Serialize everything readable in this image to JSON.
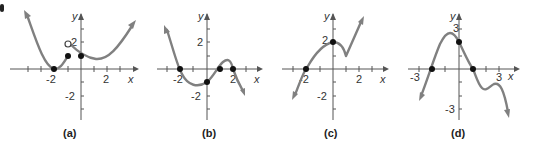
{
  "figure": {
    "panels": [
      {
        "id": "a",
        "caption": "(a)",
        "x_axis_label": "x",
        "y_axis_label": "y",
        "x_tick_labels": [
          "-2",
          "2"
        ],
        "y_tick_labels": [
          "2",
          "-2"
        ],
        "filled_points": [
          [
            -2,
            0
          ],
          [
            -1,
            1
          ],
          [
            0,
            1
          ]
        ],
        "open_points": [
          [
            -1,
            2
          ]
        ]
      },
      {
        "id": "b",
        "caption": "(b)",
        "x_axis_label": "x",
        "y_axis_label": "y",
        "x_tick_labels": [
          "-2",
          "2"
        ],
        "y_tick_labels": [
          "2",
          "-2"
        ],
        "filled_points": [
          [
            -2,
            0
          ],
          [
            0,
            -1
          ],
          [
            1,
            0
          ],
          [
            2,
            0
          ]
        ],
        "open_points": []
      },
      {
        "id": "c",
        "caption": "(c)",
        "x_axis_label": "x",
        "y_axis_label": "y",
        "x_tick_labels": [
          "-2",
          "2"
        ],
        "y_tick_labels": [
          "2",
          "-2"
        ],
        "filled_points": [
          [
            -2,
            0
          ],
          [
            0,
            2
          ]
        ],
        "open_points": []
      },
      {
        "id": "d",
        "caption": "(d)",
        "x_axis_label": "x",
        "y_axis_label": "y",
        "x_tick_labels": [
          "-3",
          "3"
        ],
        "y_tick_labels": [
          "3",
          "-3"
        ],
        "filled_points": [
          [
            -2,
            0
          ],
          [
            0,
            2
          ],
          [
            1,
            0
          ]
        ],
        "open_points": []
      }
    ]
  },
  "colors": {
    "curve": "#808080",
    "axis": "#555555",
    "point": "#111111"
  }
}
